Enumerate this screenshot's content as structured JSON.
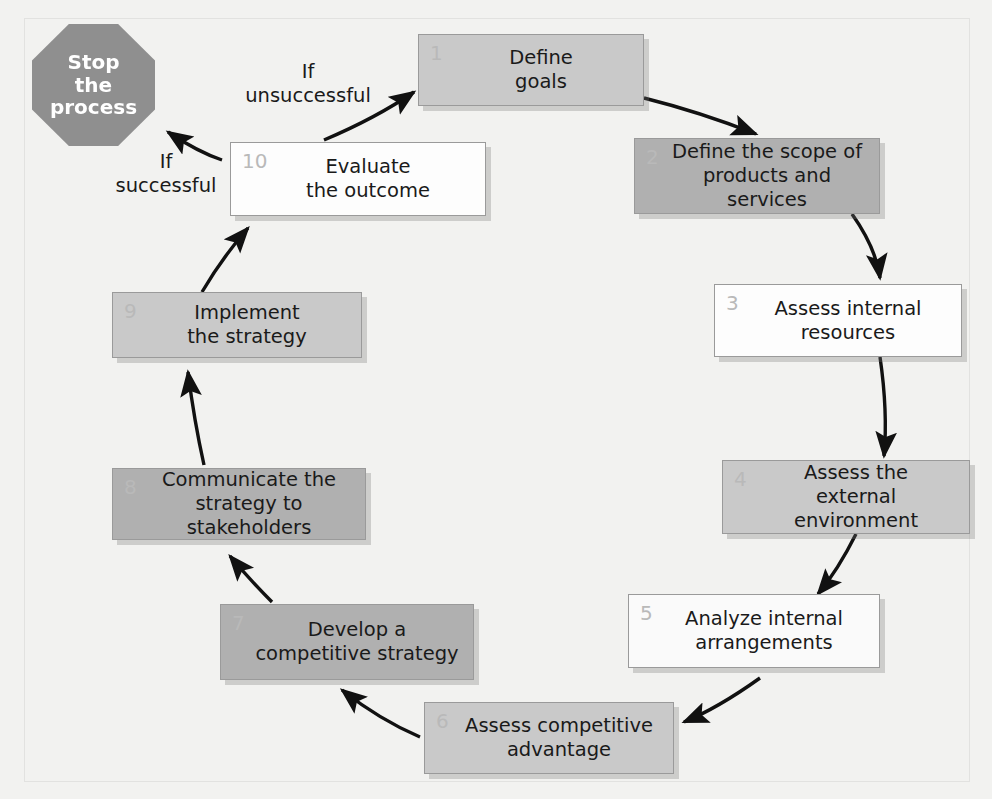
{
  "diagram": {
    "type": "cycle-flowchart",
    "background_color": "#f2f2f0",
    "terminal": {
      "name": "stop-the-process",
      "label": "Stop\nthe\nprocess",
      "shape": "octagon",
      "fill": "#8f8f8f",
      "text_color": "#ffffff"
    },
    "condition_labels": [
      {
        "name": "if-unsuccessful",
        "label": "If\nunsuccessful"
      },
      {
        "name": "if-successful",
        "label": "If\nsuccessful"
      }
    ],
    "steps": [
      {
        "num": "1",
        "label": "Define\ngoals",
        "tone": "tone-mid"
      },
      {
        "num": "2",
        "label": "Define the scope of\nproducts and services",
        "tone": "tone-dark"
      },
      {
        "num": "3",
        "label": "Assess internal\nresources",
        "tone": "tone-white"
      },
      {
        "num": "4",
        "label": "Assess the\nexternal environment",
        "tone": "tone-mid"
      },
      {
        "num": "5",
        "label": "Analyze internal\narrangements",
        "tone": "tone-light"
      },
      {
        "num": "6",
        "label": "Assess competitive\nadvantage",
        "tone": "tone-mid"
      },
      {
        "num": "7",
        "label": "Develop a\ncompetitive strategy",
        "tone": "tone-dark"
      },
      {
        "num": "8",
        "label": "Communicate the\nstrategy to stakeholders",
        "tone": "tone-dark"
      },
      {
        "num": "9",
        "label": "Implement\nthe strategy",
        "tone": "tone-mid"
      },
      {
        "num": "10",
        "label": "Evaluate\nthe outcome",
        "tone": "tone-white"
      }
    ],
    "connections": [
      {
        "from": "1",
        "to": "2"
      },
      {
        "from": "2",
        "to": "3"
      },
      {
        "from": "3",
        "to": "4"
      },
      {
        "from": "4",
        "to": "5"
      },
      {
        "from": "5",
        "to": "6"
      },
      {
        "from": "6",
        "to": "7"
      },
      {
        "from": "7",
        "to": "8"
      },
      {
        "from": "8",
        "to": "9"
      },
      {
        "from": "9",
        "to": "10"
      },
      {
        "from": "10",
        "to": "1",
        "condition": "If unsuccessful"
      },
      {
        "from": "10",
        "to": "stop-the-process",
        "condition": "If successful"
      }
    ]
  }
}
